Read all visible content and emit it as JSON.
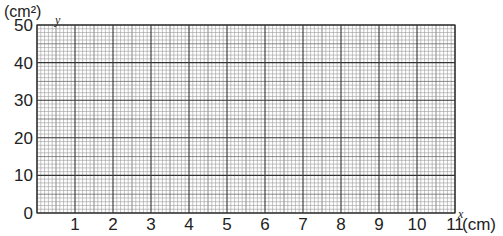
{
  "chart_data": {
    "type": "line",
    "title": "",
    "xlabel": "x",
    "ylabel": "y",
    "x_unit": "(cm)",
    "y_unit": "(cm²)",
    "xlim": [
      0,
      11
    ],
    "ylim": [
      0,
      50
    ],
    "x_ticks": [
      "1",
      "2",
      "3",
      "4",
      "5",
      "6",
      "7",
      "8",
      "9",
      "10",
      "11"
    ],
    "y_ticks": [
      "0",
      "10",
      "20",
      "30",
      "40",
      "50"
    ],
    "origin_label": "0",
    "grid": true,
    "grid_minor_per_x_unit": 10,
    "grid_minor_per_y_major": 10,
    "series": []
  },
  "labels": {
    "y_unit": "(cm²)",
    "y_axis": "y",
    "x_axis": "x",
    "x_unit": "(cm)",
    "origin": "0"
  },
  "colors": {
    "major_grid": "#333333",
    "minor_grid": "#9a9a9a",
    "text": "#222222"
  }
}
